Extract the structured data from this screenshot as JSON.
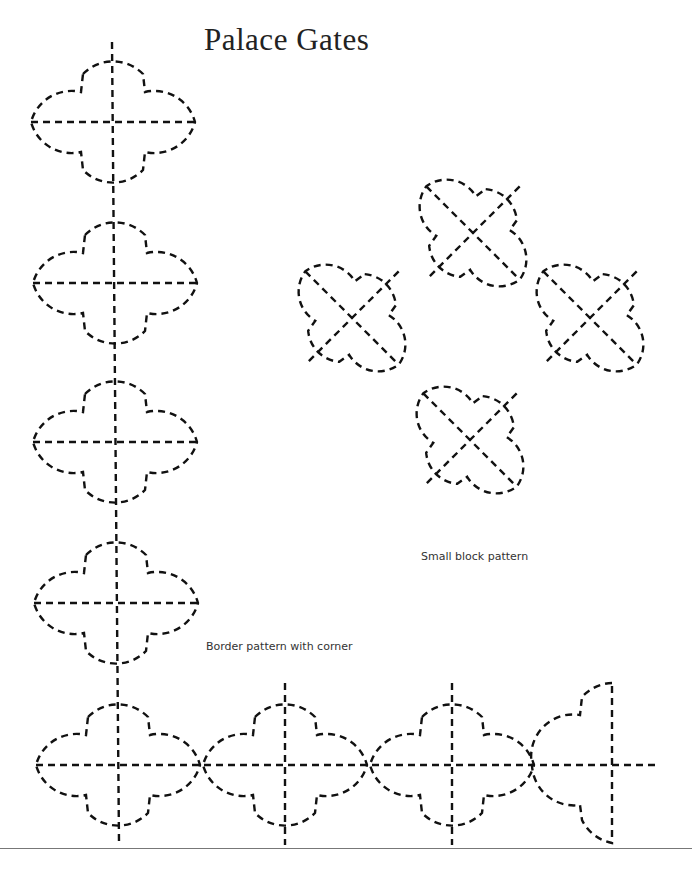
{
  "page": {
    "title": "Palace Gates",
    "captions": {
      "small_block": "Small block pattern",
      "border": "Border pattern with corner"
    }
  },
  "colors": {
    "ink": "#111111",
    "background": "#ffffff",
    "rule": "#777777"
  },
  "patterns": {
    "border_vertical_centers": [
      [
        113,
        122
      ],
      [
        115,
        283
      ],
      [
        115,
        442
      ],
      [
        116,
        603
      ]
    ],
    "border_horizontal_centers": [
      [
        118,
        765
      ],
      [
        285,
        765
      ],
      [
        452,
        765
      ]
    ],
    "border_half_unit": [
      612,
      765
    ],
    "small_block_centers": [
      [
        473,
        233
      ],
      [
        352,
        318
      ],
      [
        590,
        318
      ],
      [
        470,
        440
      ]
    ]
  }
}
